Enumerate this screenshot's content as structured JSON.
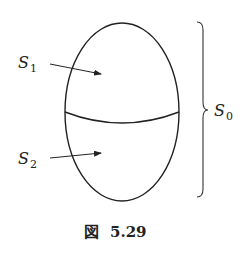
{
  "diagram": {
    "labels": {
      "s1": {
        "main": "S",
        "sub": "1"
      },
      "s2": {
        "main": "S",
        "sub": "2"
      },
      "s0": {
        "main": "S",
        "sub": "0"
      }
    },
    "caption": {
      "prefix": "図",
      "number": "5.29"
    },
    "stroke_color": "#222222"
  }
}
